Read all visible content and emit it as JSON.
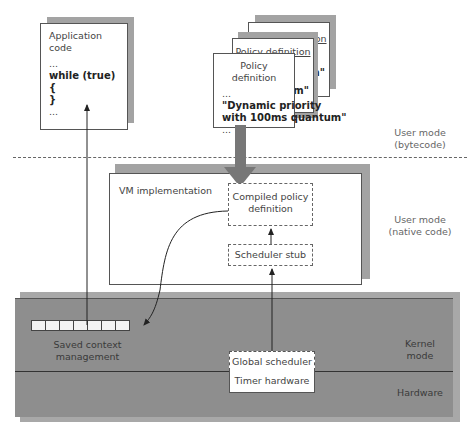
{
  "app_code": {
    "title": "Application code",
    "line1": "...",
    "line2": "while (true) {",
    "line3": "}",
    "line4": "..."
  },
  "policy_stack": {
    "back_title": "Policy definition",
    "middle_title": "Policy definition",
    "back_fragment": "m\"",
    "middle_fragment": "m\"",
    "front": {
      "title": "Policy definition",
      "line1": "...",
      "line2": "\"Dynamic priority",
      "line3": "with 100ms quantum\"",
      "line4": "..."
    }
  },
  "layers": {
    "user_bytecode": "User mode\n(bytecode)",
    "user_bytecode_l1": "User mode",
    "user_bytecode_l2": "(bytecode)",
    "user_native_l1": "User mode",
    "user_native_l2": "(native code)",
    "kernel_l1": "Kernel",
    "kernel_l2": "mode",
    "hardware": "Hardware"
  },
  "vm": {
    "title": "VM implementation",
    "compiled_l1": "Compiled policy",
    "compiled_l2": "definition",
    "stub": "Scheduler stub"
  },
  "kernel": {
    "saved_l1": "Saved context",
    "saved_l2": "management",
    "global_scheduler": "Global scheduler",
    "timer": "Timer hardware",
    "cells": 7
  },
  "colors": {
    "shadow": "#a3a3a3",
    "kernel_fill": "#8e8e8e",
    "arrow": "#777777",
    "line": "#333333"
  }
}
